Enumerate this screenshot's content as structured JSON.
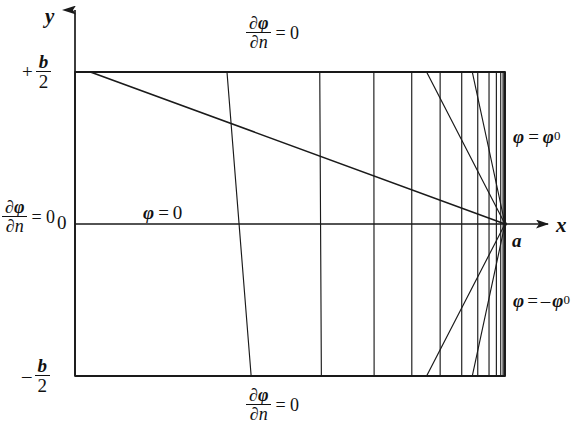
{
  "figure": {
    "type": "flow-net",
    "axes": {
      "y_axis_label": "y",
      "x_axis_label": "x",
      "origin_value": "0"
    },
    "tick_labels": {
      "top": {
        "sign": "+",
        "numerator": "b",
        "denominator": "2"
      },
      "origin": "0",
      "bottom": {
        "sign": "–",
        "numerator": "b",
        "denominator": "2"
      }
    },
    "point_label": "a",
    "boundary_conditions": {
      "top": {
        "numerator_d": "∂",
        "numerator_var": "φ",
        "denominator_d": "∂",
        "denominator_var": "n",
        "equals": "= 0"
      },
      "bottom": {
        "numerator_d": "∂",
        "numerator_var": "φ",
        "denominator_d": "∂",
        "denominator_var": "n",
        "equals": "= 0"
      },
      "left": {
        "numerator_d": "∂",
        "numerator_var": "φ",
        "denominator_d": "∂",
        "denominator_var": "n",
        "equals": "= 0"
      }
    },
    "potential_labels": {
      "center": {
        "var": "φ",
        "equals": "=",
        "value": "0"
      },
      "upper_right": {
        "var": "φ",
        "equals": "=",
        "value": "φ",
        "subscript": "0"
      },
      "lower_right": {
        "var": "φ",
        "equals": "=",
        "sign": "–",
        "value": "φ",
        "subscript": "0"
      }
    },
    "colors": {
      "line": "#1a1a1a",
      "background": "#ffffff",
      "text": "#111111"
    },
    "geometry": {
      "left": 75,
      "right": 505,
      "top": 72,
      "bottom": 376,
      "sink_x": 505,
      "sink_y": 224,
      "n_streamlines": 13,
      "n_equipotentials": 15
    }
  }
}
